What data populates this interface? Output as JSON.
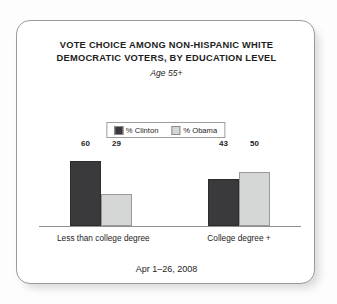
{
  "card": {
    "title_line_1": "VOTE CHOICE AMONG NON-HISPANIC WHITE",
    "title_line_2": "DEMOCRATIC VOTERS, BY EDUCATION LEVEL",
    "subtitle": "Age 55+",
    "footer": "Apr 1–26, 2008"
  },
  "legend": {
    "items": [
      {
        "label": "% Clinton",
        "color": "#3a3a3c"
      },
      {
        "label": "% Obama",
        "color": "#d5d6d6"
      }
    ]
  },
  "chart_data": {
    "type": "bar",
    "title": "VOTE CHOICE AMONG NON-HISPANIC WHITE DEMOCRATIC VOTERS, BY EDUCATION LEVEL",
    "subtitle": "Age 55+",
    "note": "Apr 1–26, 2008",
    "categories": [
      "Less than college degree",
      "College degree +"
    ],
    "series": [
      {
        "name": "% Clinton",
        "color": "#3a3a3c",
        "values": [
          60,
          29
        ]
      },
      {
        "name": "% Obama",
        "color": "#d5d6d6",
        "values": [
          43,
          50
        ]
      }
    ],
    "groups": [
      {
        "category": "Less than college degree",
        "bars": [
          {
            "series": "% Clinton",
            "value": 60,
            "label": "60"
          },
          {
            "series": "% Obama",
            "value": 29,
            "label": "29"
          }
        ]
      },
      {
        "category": "College degree +",
        "bars": [
          {
            "series": "% Clinton",
            "value": 43,
            "label": "43"
          },
          {
            "series": "% Obama",
            "value": 50,
            "label": "50"
          }
        ]
      }
    ],
    "xlabel": "",
    "ylabel": "",
    "ylim": [
      0,
      70
    ],
    "grid": false,
    "legend_position": "top-center",
    "value_labels": true
  }
}
